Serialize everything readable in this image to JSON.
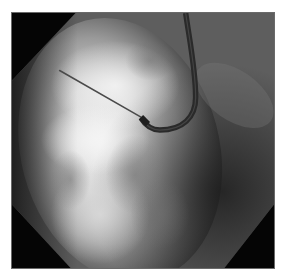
{
  "image": {
    "description": "Fluoroscopic X-ray view of the heart with a curved sheath/catheter entering from the top and a straight needle extending toward the upper left",
    "modality": "fluoroscopy",
    "colors": {
      "background": "#ffffff",
      "collimator": "#050505",
      "border": "#6a6a6a",
      "bright_tissue": "#e8e8e8",
      "mid_tissue": "#8c8c8c",
      "catheter": "#2a2a2a",
      "needle": "#4a4a4a"
    },
    "frame": {
      "x": 11,
      "y": 12,
      "width": 264,
      "height": 257
    },
    "objects": [
      {
        "name": "catheter-sheath",
        "shape": "J-curve",
        "from": [
          186,
          12
        ],
        "bend": [
          158,
          128
        ],
        "to": [
          140,
          116
        ]
      },
      {
        "name": "needle",
        "shape": "straight-line",
        "from": [
          140,
          117
        ],
        "to": [
          59,
          70
        ]
      }
    ]
  }
}
